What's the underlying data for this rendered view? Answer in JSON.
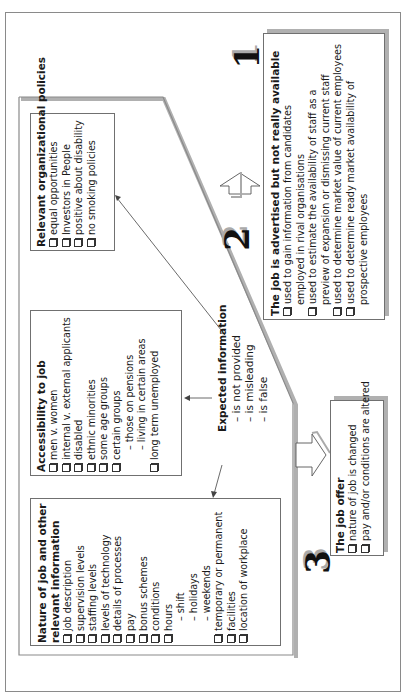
{
  "diagram": {
    "stage1": {
      "number": "1",
      "title": "The job is advertised but not really available",
      "items": [
        {
          "text": "used to gain information from candidates",
          "cont": "employed in rival organisations"
        },
        {
          "text": "used to estimate the availability of staff as a",
          "cont": "preview of expansion or dismissing current staff"
        },
        {
          "text": "used to determine market value of current employees",
          "cont": ""
        },
        {
          "text": "used to determine ready market availability of",
          "cont": "prospective employees"
        }
      ]
    },
    "stage2": {
      "number": "2",
      "policies": {
        "title": "Relevant organizational policies",
        "items": [
          "equal opportunities",
          "Investors in People",
          "positive about disability",
          "no smoking policies"
        ]
      },
      "accessibility": {
        "title": "Accessibility to job",
        "items": [
          "men v. women",
          "internal v. external applicants",
          "disabled",
          "ethnic minorities",
          "some age groups",
          "certain groups"
        ],
        "certain_groups_sub": [
          "– those on pensions",
          "– living in certain areas"
        ],
        "last_item": "long term unemployed"
      },
      "nature": {
        "title_line1": "Nature of job and other",
        "title_line2": "relevant information",
        "items": [
          "job description",
          "supervision levels",
          "staffing levels",
          "levels of technology",
          "details of processes",
          "pay",
          "bonus schemes",
          "conditions",
          "hours"
        ],
        "hours_sub": [
          "– shift",
          "– holidays",
          "– weekends"
        ],
        "items_after": [
          "temporary or permanent",
          "facilities",
          "location of workplace"
        ]
      },
      "expected": {
        "title": "Expected information",
        "lines": [
          "– is not provided",
          "– is misleading",
          "– is false"
        ]
      }
    },
    "stage3": {
      "number": "3",
      "title": "The job offer",
      "items": [
        "nature of job is changed",
        "pay and/or conditions are altered"
      ]
    },
    "colors": {
      "line": "#8a8a8a",
      "shadow": "#b0b0b0",
      "text": "#1a1a1a",
      "background": "#ffffff"
    }
  }
}
